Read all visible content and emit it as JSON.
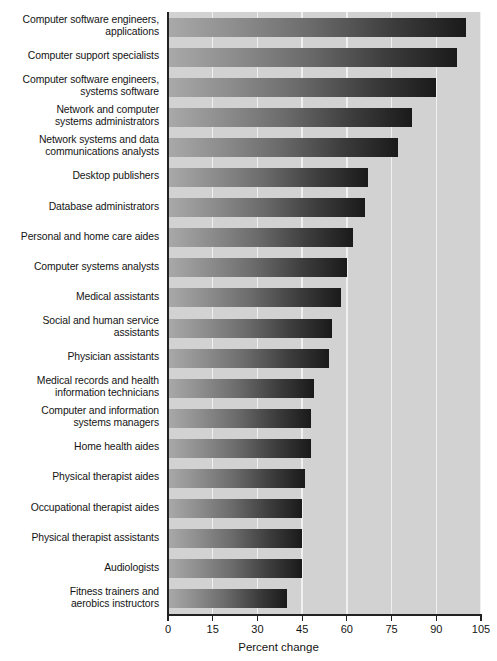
{
  "chart_data": {
    "type": "bar",
    "orientation": "horizontal",
    "title": "",
    "xlabel": "Percent change",
    "ylabel": "",
    "xlim": [
      0,
      105
    ],
    "xticks": [
      0,
      15,
      30,
      45,
      60,
      75,
      90,
      105
    ],
    "xtick_labels": [
      "0",
      "15",
      "30",
      "45",
      "60",
      "75",
      "90",
      "105"
    ],
    "grid": true,
    "grid_axis": "x",
    "legend": "none",
    "categories": [
      "Computer software engineers, applications",
      "Computer support specialists",
      "Computer software engineers, systems software",
      "Network and computer systems administrators",
      "Network systems and data communications analysts",
      "Desktop publishers",
      "Database administrators",
      "Personal and home care aides",
      "Computer systems analysts",
      "Medical assistants",
      "Social and human service assistants",
      "Physician assistants",
      "Medical records and health information technicians",
      "Computer and information systems managers",
      "Home health aides",
      "Physical therapist aides",
      "Occupational therapist aides",
      "Physical therapist assistants",
      "Audiologists",
      "Fitness trainers and aerobics instructors"
    ],
    "category_lines": [
      [
        "Computer software engineers,",
        "applications"
      ],
      [
        "Computer support specialists"
      ],
      [
        "Computer software engineers,",
        "systems software"
      ],
      [
        "Network and computer",
        "systems administrators"
      ],
      [
        "Network systems and data",
        "communications analysts"
      ],
      [
        "Desktop publishers"
      ],
      [
        "Database administrators"
      ],
      [
        "Personal and home care aides"
      ],
      [
        "Computer systems analysts"
      ],
      [
        "Medical assistants"
      ],
      [
        "Social and human service",
        "assistants"
      ],
      [
        "Physician assistants"
      ],
      [
        "Medical records and health",
        "information technicians"
      ],
      [
        "Computer and information",
        "systems managers"
      ],
      [
        "Home health aides"
      ],
      [
        "Physical therapist aides"
      ],
      [
        "Occupational therapist aides"
      ],
      [
        "Physical therapist assistants"
      ],
      [
        "Audiologists"
      ],
      [
        "Fitness trainers and",
        "aerobics instructors"
      ]
    ],
    "values": [
      100,
      97,
      90,
      82,
      77,
      67,
      66,
      62,
      60,
      58,
      55,
      54,
      49,
      48,
      48,
      46,
      45,
      45,
      45,
      40
    ],
    "colors": {
      "plot_background": "#d2d2d2",
      "gridline": "#f0f0f0",
      "axis": "#222222",
      "bar_gradient_start": "#a9a9a9",
      "bar_gradient_end": "#1a1a1a",
      "text": "#141414",
      "page_background": "#ffffff"
    }
  }
}
